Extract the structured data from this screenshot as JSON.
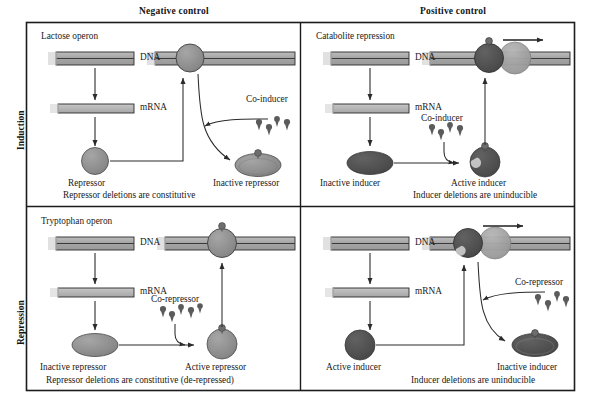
{
  "figure": {
    "background": "#ffffff",
    "border_color": "#1c1c1c",
    "dna_fill": "#a8a8a8",
    "dna_edge": "#2b2b2b",
    "rna_fill": "#b4b4b4",
    "protein_gray": "#8d8d8d",
    "protein_dark": "#4f4f4f",
    "polymerase_fill": "#a0a0a0",
    "arrow_color": "#2b2b2b",
    "ligand_color": "#5b5b5b"
  },
  "column_headers": [
    {
      "id": "negative-control",
      "label": "Negative control"
    },
    {
      "id": "positive-control",
      "label": "Positive control"
    }
  ],
  "row_headers": [
    {
      "id": "induction",
      "label": "Induction"
    },
    {
      "id": "repression",
      "label": "Repression"
    }
  ],
  "panels": [
    {
      "id": "lactose-operon",
      "row": "Induction",
      "column": "Negative control",
      "title": "Lactose operon",
      "caption": "Repressor deletions are constitutive",
      "labels": {
        "dna": "DNA",
        "mrna": "mRNA",
        "regulator": "Repressor",
        "ligand": "Co-inducer",
        "product": "Inactive repressor"
      },
      "bound_protein": "repressor-on-operator",
      "transcribing": false
    },
    {
      "id": "catabolite-repression",
      "row": "Induction",
      "column": "Positive control",
      "title": "Catabolite repression",
      "caption": "Inducer deletions are uninducible",
      "labels": {
        "dna": "DNA",
        "mrna": "mRNA",
        "regulator": "Inactive inducer",
        "ligand": "Co-inducer",
        "product": "Active inducer"
      },
      "bound_protein": "active-inducer-on-promoter",
      "transcribing": true
    },
    {
      "id": "tryptophan-operon",
      "row": "Repression",
      "column": "Negative control",
      "title": "Tryptophan operon",
      "caption": "Repressor deletions are constitutive (de-repressed)",
      "labels": {
        "dna": "DNA",
        "mrna": "mRNA",
        "regulator": "Inactive repressor",
        "ligand": "Co-repressor",
        "product": "Active repressor"
      },
      "bound_protein": "active-repressor-on-operator",
      "transcribing": false
    },
    {
      "id": "positive-control-repression",
      "row": "Repression",
      "column": "Positive control",
      "title": "",
      "caption": "Inducer deletions are uninducible",
      "labels": {
        "dna": "DNA",
        "mrna": "mRNA",
        "regulator": "Active inducer",
        "ligand": "Co-repressor",
        "product": "Inactive inducer"
      },
      "bound_protein": "active-inducer-on-promoter",
      "transcribing": true
    }
  ]
}
